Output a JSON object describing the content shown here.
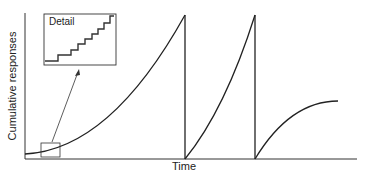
{
  "figure": {
    "y_axis_label": "Cumulative responses",
    "x_axis_label": "Time",
    "inset_label": "Detail"
  },
  "colors": {
    "line": "#222222",
    "background": "#ffffff"
  }
}
